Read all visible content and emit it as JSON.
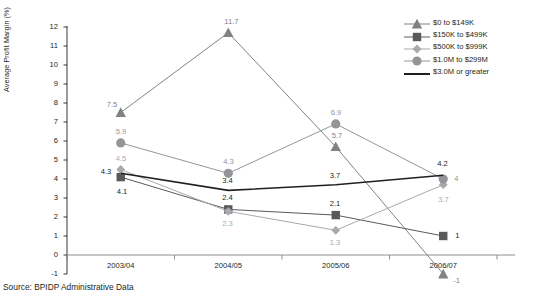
{
  "source_note": "Source: BPIDP Administrative Data",
  "axis": {
    "ylabel": "Average Profit Margin (%)",
    "yticks": [
      "12",
      "11",
      "10",
      "9",
      "8",
      "7",
      "6",
      "5",
      "4",
      "3",
      "2",
      "1",
      "0",
      "-1"
    ],
    "xticks": [
      "2003/04",
      "2004/05",
      "2005/06",
      "2006/07"
    ]
  },
  "legend": {
    "items": [
      {
        "label": "$0 to $149K",
        "marker": "triangle-marker",
        "color": "#808285"
      },
      {
        "label": "$150K to $499K",
        "marker": "square-marker",
        "color": "#58595b"
      },
      {
        "label": "$500K to $999K",
        "marker": "diamond-marker",
        "color": "#a7a9ac"
      },
      {
        "label": "$1.0M to $299M",
        "marker": "circle-marker",
        "color": "#939598"
      },
      {
        "label": "$3.0M or greater",
        "marker": "line-marker",
        "color": "#231f20"
      }
    ]
  },
  "chart_data": {
    "type": "line",
    "title": "",
    "xlabel": "",
    "ylabel": "Average Profit Margin (%)",
    "categories": [
      "2003/04",
      "2004/05",
      "2005/06",
      "2006/07"
    ],
    "ylim": [
      -1,
      12
    ],
    "ytick_step": 1,
    "grid": false,
    "legend_position": "top-right",
    "series": [
      {
        "name": "$0 to $149K",
        "marker": "triangle",
        "color": "#808285",
        "values": [
          7.5,
          11.7,
          5.7,
          -1
        ],
        "labels": [
          "7.5",
          "11.7",
          "5.7",
          "-1"
        ]
      },
      {
        "name": "$150K to $499K",
        "marker": "square",
        "color": "#58595b",
        "values": [
          4.1,
          2.4,
          2.1,
          1
        ],
        "labels": [
          "4.1",
          "2.4",
          "2.1",
          "1"
        ]
      },
      {
        "name": "$500K to $999K",
        "marker": "diamond",
        "color": "#a7a9ac",
        "values": [
          4.5,
          2.3,
          1.3,
          3.7
        ],
        "labels": [
          "4.5",
          "2.3",
          "1.3",
          "3.7"
        ]
      },
      {
        "name": "$1.0M to $299M",
        "marker": "circle",
        "color": "#939598",
        "values": [
          5.9,
          4.3,
          6.9,
          4
        ],
        "labels": [
          "5.9",
          "4.3",
          "6.9",
          "4"
        ]
      },
      {
        "name": "$3.0M or greater",
        "marker": "none",
        "color": "#231f20",
        "values": [
          4.3,
          3.4,
          3.7,
          4.2
        ],
        "labels": [
          "4.3",
          "3.4",
          "3.7",
          "4.2"
        ]
      }
    ]
  }
}
